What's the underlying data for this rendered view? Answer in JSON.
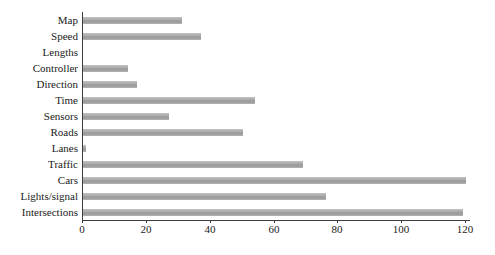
{
  "chart_data": {
    "type": "bar",
    "orientation": "horizontal",
    "title": "",
    "xlabel": "",
    "ylabel": "",
    "categories": [
      "Map",
      "Speed",
      "Lengths",
      "Controller",
      "Direction",
      "Time",
      "Sensors",
      "Roads",
      "Lanes",
      "Traffic",
      "Cars",
      "Lights/signal",
      "Intersections"
    ],
    "values": [
      31,
      37,
      0,
      14,
      17,
      54,
      27,
      50,
      1,
      69,
      120,
      76,
      119
    ],
    "xlim": [
      0,
      120
    ],
    "xticks": [
      "0",
      "20",
      "40",
      "60",
      "80",
      "100",
      "120"
    ],
    "xtick_values": [
      0,
      20,
      40,
      60,
      80,
      100,
      120
    ],
    "grid": false,
    "legend": null,
    "colors": {
      "bar_light": "#c3c3c3",
      "bar_mid": "#a5a5a5",
      "bar_dark": "#9a9a9a",
      "bar_bottom": "#b2b2b2",
      "axis": "#3c3c3c",
      "text": "#1a1a1a",
      "background": "#ffffff"
    }
  }
}
